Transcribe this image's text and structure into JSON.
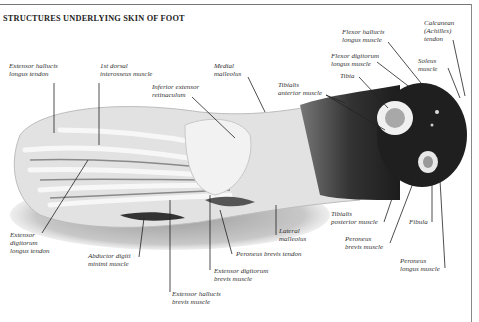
{
  "header": {
    "title": "STRUCTURES UNDERLYING SKIN OF FOOT",
    "corner_text": "FOOT"
  },
  "diagram": {
    "labels": [
      {
        "id": "extensor-hallucis-longus-tendon",
        "text": "Extensor hallucis\nlongus tendon"
      },
      {
        "id": "first-dorsal-interosseus-muscle",
        "text": "1st dorsal\ninterosseus muscle"
      },
      {
        "id": "medial-malleolus",
        "text": "Medial\nmalleolus"
      },
      {
        "id": "inferior-extensor-retinaculum",
        "text": "Inferior extensor\nretinaculum"
      },
      {
        "id": "flexor-hallucis-longus-muscle",
        "text": "Flexor hallucis\nlongus muscle"
      },
      {
        "id": "calcanean-achilles-tendon",
        "text": "Calcanean\n(Achilles)\ntendon"
      },
      {
        "id": "flexor-digitorum-longus-muscle",
        "text": "Flexor digitorum\nlongus muscle"
      },
      {
        "id": "soleus-muscle",
        "text": "Soleus\nmuscle"
      },
      {
        "id": "tibia",
        "text": "Tibia"
      },
      {
        "id": "tibialis-anterior-muscle",
        "text": "Tibialis\nanterior muscle"
      },
      {
        "id": "extensor-digitorum-longus-tendon",
        "text": "Extensor\ndigitorum\nlongus tendon"
      },
      {
        "id": "abductor-digiti-minimi-muscle",
        "text": "Abductor digiti\nminimi muscle"
      },
      {
        "id": "extensor-hallucis-brevis-muscle",
        "text": "Extensor hallucis\nbrevis muscle"
      },
      {
        "id": "extensor-digitorum-brevis-muscle",
        "text": "Extensor digitorum\nbrevis muscle"
      },
      {
        "id": "peroneus-brevis-tendon",
        "text": "Peroneus brevis tendon"
      },
      {
        "id": "lateral-malleolus",
        "text": "Lateral\nmalleolus"
      },
      {
        "id": "tibialis-posterior-muscle",
        "text": "Tibialis\nposterior muscle"
      },
      {
        "id": "peroneus-brevis-muscle",
        "text": "Peroneus\nbrevis muscle"
      },
      {
        "id": "fibula",
        "text": "Fibula"
      },
      {
        "id": "peroneus-longus-muscle",
        "text": "Peroneus\nlongus muscle"
      }
    ]
  }
}
